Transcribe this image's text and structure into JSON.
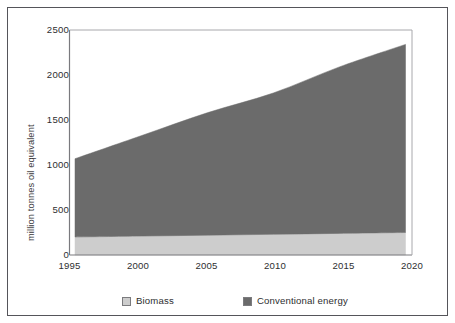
{
  "figure": {
    "background_color": "#ffffff",
    "frame_color": "#55555a"
  },
  "axes": {
    "y_title": "million tonnes oil equivalent",
    "y_ticks": [
      "0",
      "500",
      "1000",
      "1500",
      "2000",
      "2500"
    ],
    "x_ticks": [
      "1995",
      "2000",
      "2005",
      "2010",
      "2015",
      "2020"
    ]
  },
  "legend": {
    "items": [
      {
        "label": "Biomass",
        "color": "#cdcdcd"
      },
      {
        "label": "Conventional energy",
        "color": "#6b6b6b"
      }
    ]
  },
  "chart_data": {
    "type": "area",
    "stacked": true,
    "title": "",
    "subtitle": "",
    "xlabel": "",
    "ylabel": "million tonnes oil equivalent",
    "xlim": [
      1995,
      2020
    ],
    "ylim": [
      0,
      2500
    ],
    "ytick_values": [
      0,
      500,
      1000,
      1500,
      2000,
      2500
    ],
    "xtick_values": [
      1995,
      2000,
      2005,
      2010,
      2015,
      2020
    ],
    "grid": false,
    "legend_position": "bottom",
    "x": [
      1995,
      2000,
      2005,
      2010,
      2015,
      2020
    ],
    "series": [
      {
        "name": "Biomass",
        "color": "#cdcdcd",
        "values": [
          200,
          210,
          220,
          230,
          240,
          250
        ]
      },
      {
        "name": "Conventional energy",
        "color": "#6b6b6b",
        "values": [
          870,
          1115,
          1360,
          1570,
          1850,
          2090
        ]
      }
    ],
    "stack_totals": [
      1070,
      1325,
      1580,
      1800,
      2090,
      2340
    ],
    "annotations": []
  }
}
